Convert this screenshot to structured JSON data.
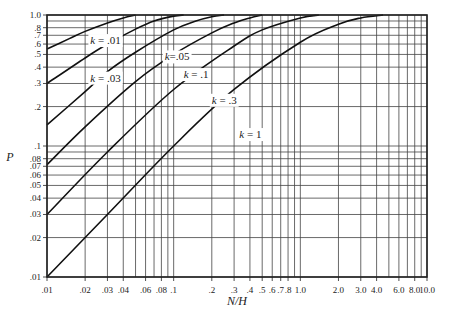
{
  "chart_data": {
    "type": "line",
    "title": "",
    "xlabel": "N/H",
    "ylabel": "P",
    "xscale": "log",
    "yscale": "log",
    "xlim": [
      0.01,
      10.0
    ],
    "ylim": [
      0.01,
      1.0
    ],
    "grid": true,
    "legend": "inline curve labels",
    "x_ticks": [
      0.01,
      0.02,
      0.03,
      0.04,
      0.06,
      0.08,
      0.1,
      0.2,
      0.3,
      0.4,
      0.5,
      0.6,
      0.7,
      0.8,
      1.0,
      2.0,
      3.0,
      4.0,
      6.0,
      8.0,
      10.0
    ],
    "x_tick_labels": [
      ".01",
      ".02",
      ".03",
      ".04",
      ".06",
      ".08",
      ".1",
      ".2",
      ".3",
      ".4",
      ".5",
      ".6",
      ".7",
      ".8",
      "1.0",
      "2.0",
      "3.0",
      "4.0",
      "6.0",
      "8.0",
      "10.0"
    ],
    "x_grid": [
      0.01,
      0.02,
      0.03,
      0.04,
      0.05,
      0.06,
      0.07,
      0.08,
      0.09,
      0.1,
      0.2,
      0.3,
      0.4,
      0.5,
      0.6,
      0.7,
      0.8,
      0.9,
      1.0,
      2.0,
      3.0,
      4.0,
      5.0,
      6.0,
      7.0,
      8.0,
      9.0,
      10.0
    ],
    "y_ticks": [
      0.01,
      0.02,
      0.03,
      0.04,
      0.05,
      0.06,
      0.07,
      0.08,
      0.1,
      0.2,
      0.3,
      0.4,
      0.5,
      0.6,
      0.7,
      0.8,
      1.0
    ],
    "y_tick_labels": [
      ".01",
      ".02",
      ".03",
      ".04",
      ".05",
      ".06",
      ".07",
      ".08",
      ".1",
      ".2",
      ".3",
      ".4",
      ".5",
      ".6",
      ".7",
      ".8",
      "1.0"
    ],
    "y_grid": [
      0.01,
      0.02,
      0.03,
      0.04,
      0.05,
      0.06,
      0.07,
      0.08,
      0.09,
      0.1,
      0.2,
      0.3,
      0.4,
      0.5,
      0.6,
      0.7,
      0.8,
      0.9,
      1.0
    ],
    "series": [
      {
        "name": "k = .01",
        "label": "k = .01",
        "label_pos": [
          0.022,
          0.6
        ],
        "points": [
          [
            0.01,
            0.55
          ],
          [
            0.015,
            0.66
          ],
          [
            0.02,
            0.75
          ],
          [
            0.03,
            0.87
          ],
          [
            0.04,
            0.95
          ],
          [
            0.05,
            1.0
          ]
        ]
      },
      {
        "name": "k = .03",
        "label": "k = .03",
        "label_pos": [
          0.022,
          0.31
        ],
        "points": [
          [
            0.01,
            0.3
          ],
          [
            0.02,
            0.47
          ],
          [
            0.03,
            0.6
          ],
          [
            0.05,
            0.78
          ],
          [
            0.07,
            0.9
          ],
          [
            0.1,
            0.98
          ],
          [
            0.12,
            1.0
          ]
        ]
      },
      {
        "name": "k=.05",
        "label": "k=.05",
        "label_pos": [
          0.085,
          0.45
        ],
        "points": [
          [
            0.01,
            0.145
          ],
          [
            0.02,
            0.26
          ],
          [
            0.03,
            0.37
          ],
          [
            0.05,
            0.52
          ],
          [
            0.1,
            0.77
          ],
          [
            0.15,
            0.9
          ],
          [
            0.2,
            0.97
          ],
          [
            0.25,
            1.0
          ]
        ]
      },
      {
        "name": "k = .1",
        "label": "k = .1",
        "label_pos": [
          0.12,
          0.33
        ],
        "points": [
          [
            0.01,
            0.072
          ],
          [
            0.02,
            0.14
          ],
          [
            0.05,
            0.31
          ],
          [
            0.1,
            0.5
          ],
          [
            0.2,
            0.73
          ],
          [
            0.3,
            0.87
          ],
          [
            0.4,
            0.95
          ],
          [
            0.5,
            1.0
          ]
        ]
      },
      {
        "name": "k = .3",
        "label": "k = .3",
        "label_pos": [
          0.2,
          0.21
        ],
        "points": [
          [
            0.01,
            0.03
          ],
          [
            0.03,
            0.09
          ],
          [
            0.1,
            0.27
          ],
          [
            0.3,
            0.58
          ],
          [
            0.5,
            0.77
          ],
          [
            1.0,
            0.95
          ],
          [
            1.4,
            1.0
          ]
        ]
      },
      {
        "name": "k = 1",
        "label": "k = 1",
        "label_pos": [
          0.33,
          0.115
        ],
        "points": [
          [
            0.01,
            0.01
          ],
          [
            0.03,
            0.03
          ],
          [
            0.1,
            0.1
          ],
          [
            0.3,
            0.27
          ],
          [
            1.0,
            0.62
          ],
          [
            2.0,
            0.85
          ],
          [
            3.0,
            0.95
          ],
          [
            4.5,
            1.0
          ]
        ]
      }
    ]
  }
}
